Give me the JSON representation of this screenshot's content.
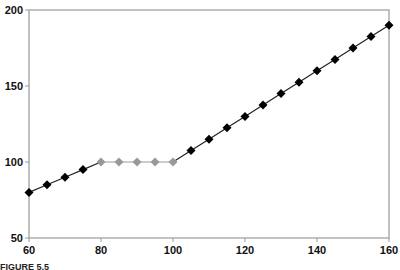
{
  "chart_data": {
    "type": "line",
    "title": "",
    "xlabel": "",
    "ylabel": "",
    "xlim": [
      60,
      160
    ],
    "ylim": [
      50,
      200
    ],
    "x_ticks": [
      60,
      80,
      100,
      120,
      140,
      160
    ],
    "y_ticks": [
      50,
      100,
      150,
      200
    ],
    "grid": false,
    "legend": null,
    "series": [
      {
        "name": "rising-segment-1",
        "color": "#000000",
        "marker": "diamond",
        "x": [
          60,
          65,
          70,
          75,
          80
        ],
        "y": [
          80,
          85,
          90,
          95,
          100
        ]
      },
      {
        "name": "flat-segment",
        "color": "#999999",
        "marker": "diamond",
        "x": [
          80,
          85,
          90,
          95,
          100
        ],
        "y": [
          100,
          100,
          100,
          100,
          100
        ]
      },
      {
        "name": "rising-segment-2",
        "color": "#000000",
        "marker": "diamond",
        "x": [
          100,
          105,
          110,
          115,
          120,
          125,
          130,
          135,
          140,
          145,
          150,
          155,
          160
        ],
        "y": [
          100,
          107.5,
          115,
          122.5,
          130,
          137.5,
          145,
          152.5,
          160,
          167.5,
          175,
          182.5,
          190
        ]
      }
    ],
    "marker_points": [
      {
        "x": 60,
        "y": 80,
        "color": "#000000"
      },
      {
        "x": 65,
        "y": 85,
        "color": "#000000"
      },
      {
        "x": 70,
        "y": 90,
        "color": "#000000"
      },
      {
        "x": 75,
        "y": 95,
        "color": "#000000"
      },
      {
        "x": 80,
        "y": 100,
        "color": "#999999"
      },
      {
        "x": 85,
        "y": 100,
        "color": "#999999"
      },
      {
        "x": 90,
        "y": 100,
        "color": "#999999"
      },
      {
        "x": 95,
        "y": 100,
        "color": "#999999"
      },
      {
        "x": 100,
        "y": 100,
        "color": "#999999"
      },
      {
        "x": 105,
        "y": 107.5,
        "color": "#000000"
      },
      {
        "x": 110,
        "y": 115,
        "color": "#000000"
      },
      {
        "x": 115,
        "y": 122.5,
        "color": "#000000"
      },
      {
        "x": 120,
        "y": 130,
        "color": "#000000"
      },
      {
        "x": 125,
        "y": 137.5,
        "color": "#000000"
      },
      {
        "x": 130,
        "y": 145,
        "color": "#000000"
      },
      {
        "x": 135,
        "y": 152.5,
        "color": "#000000"
      },
      {
        "x": 140,
        "y": 160,
        "color": "#000000"
      },
      {
        "x": 145,
        "y": 167.5,
        "color": "#000000"
      },
      {
        "x": 150,
        "y": 175,
        "color": "#000000"
      },
      {
        "x": 155,
        "y": 182.5,
        "color": "#000000"
      },
      {
        "x": 160,
        "y": 190,
        "color": "#000000"
      }
    ]
  },
  "colors": {
    "axis": "#999999",
    "dark_series": "#000000",
    "light_series": "#999999"
  },
  "caption": {
    "label": "FIGURE 5.5"
  }
}
